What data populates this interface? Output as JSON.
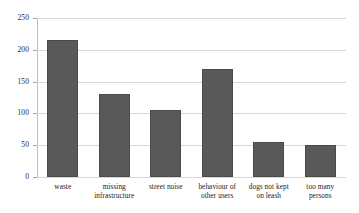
{
  "chart_data": {
    "type": "bar",
    "title": "",
    "subtitle": "",
    "xlabel": "",
    "ylabel": "",
    "ylim": [
      0,
      250
    ],
    "yticks": [
      0,
      50,
      100,
      150,
      200,
      250
    ],
    "grid": true,
    "legend": false,
    "legend_position": "none",
    "bar_color": "#595959",
    "gridline_color": "#d9d9d9",
    "axis_color": "#bfbfbf",
    "categories": [
      "waste",
      "missing infrastructure",
      "street noise",
      "behaviour of other users",
      "dogs not kept on leash",
      "too many persons"
    ],
    "category_lines": [
      [
        "waste"
      ],
      [
        "missing",
        "infrastructure"
      ],
      [
        "street noise"
      ],
      [
        "behaviour of",
        "other users"
      ],
      [
        "dogs not kept",
        "on leash"
      ],
      [
        "too many",
        "persons"
      ]
    ],
    "values": [
      215,
      130,
      105,
      170,
      55,
      50
    ]
  }
}
